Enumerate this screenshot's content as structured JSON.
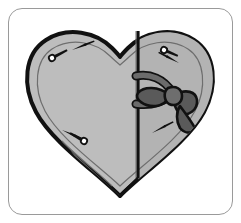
{
  "figure": {
    "style": "grayscale line art diagram",
    "background_color": "#ffffff"
  },
  "frame": {
    "name": "rounded-panel",
    "border_color": "#9a9a9a",
    "fill_color": "#ffffff",
    "corner_radius": 14,
    "x": 8,
    "y": 8,
    "width": 225,
    "height": 207
  },
  "palette": {
    "outline": "#111111",
    "body_fill": "#bdbdbd",
    "body_fill_right": "#b3b3b3",
    "inset_line": "#6e6e6e",
    "ribbon_dark": "#4f4f4f",
    "ribbon_mid": "#6b6b6b",
    "ribbon_light": "#8a8a8a",
    "marker": "#1a1a1a",
    "shadow": "#a0a0a0"
  },
  "shapes": {
    "heart": {
      "name": "heart-body",
      "label": "heart outline",
      "stroke_width": 4,
      "fill": "#bdbdbd"
    },
    "right_panel": {
      "name": "heart-right-half",
      "label": "folded right half",
      "fill": "#b3b3b3"
    },
    "fold_line": {
      "name": "center-fold-line",
      "label": "vertical center fold",
      "x": 138,
      "y_top": 30,
      "y_bottom": 196
    },
    "inset_line": {
      "name": "inner-inset-contour",
      "label": "inner offset contour line",
      "stroke_width": 1
    }
  },
  "ribbon": {
    "name": "ribbon-bow",
    "label": "ribbon bow",
    "knot": {
      "name": "bow-knot",
      "cx": 172,
      "cy": 96
    },
    "loops": [
      {
        "name": "bow-loop-left",
        "side": "left"
      },
      {
        "name": "bow-loop-right",
        "side": "right"
      }
    ],
    "straps": [
      {
        "name": "ribbon-strap-upper",
        "direction": "up-left"
      },
      {
        "name": "ribbon-strap-lower",
        "direction": "down-left"
      }
    ],
    "tail": {
      "name": "ribbon-tail",
      "direction": "down-right"
    }
  },
  "markers": [
    {
      "id": "m1",
      "name": "pin-marker-upper-left",
      "type": "pin",
      "x": 52,
      "y": 58,
      "angle": -28
    },
    {
      "id": "m2",
      "name": "arrow-marker-upper-left",
      "type": "arrow",
      "x": 72,
      "y": 50,
      "angle": -22
    },
    {
      "id": "m3",
      "name": "arrow-marker-lower-left",
      "type": "arrow",
      "x": 62,
      "y": 130,
      "angle": 24
    },
    {
      "id": "m4",
      "name": "pin-marker-lower-left",
      "type": "pin",
      "x": 84,
      "y": 141,
      "angle": 30
    },
    {
      "id": "m5",
      "name": "pin-marker-upper-right",
      "type": "pin",
      "x": 164,
      "y": 50,
      "angle": 22
    },
    {
      "id": "m6",
      "name": "arrow-marker-upper-right",
      "type": "arrow",
      "x": 179,
      "y": 63,
      "angle": 28
    },
    {
      "id": "m7",
      "name": "arrow-marker-lower-right",
      "type": "arrow",
      "x": 152,
      "y": 133,
      "angle": -28
    }
  ],
  "counts": {
    "markers_total": 7,
    "pins": 3,
    "arrows": 4
  }
}
